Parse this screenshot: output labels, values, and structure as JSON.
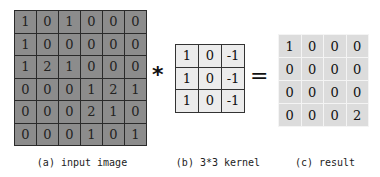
{
  "input_image": {
    "rows": [
      [
        "1",
        "0",
        "1",
        "0",
        "0",
        "0"
      ],
      [
        "1",
        "0",
        "0",
        "0",
        "0",
        "0"
      ],
      [
        "1",
        "2",
        "1",
        "0",
        "0",
        "0"
      ],
      [
        "0",
        "0",
        "0",
        "1",
        "2",
        "1"
      ],
      [
        "0",
        "0",
        "0",
        "2",
        "1",
        "0"
      ],
      [
        "0",
        "0",
        "0",
        "1",
        "0",
        "1"
      ]
    ],
    "caption": "(a) input image"
  },
  "operators": {
    "convolve": "*",
    "equals": "="
  },
  "kernel": {
    "rows": [
      [
        "1",
        "0",
        "-1"
      ],
      [
        "1",
        "0",
        "-1"
      ],
      [
        "1",
        "0",
        "-1"
      ]
    ],
    "caption": "(b) 3*3 kernel"
  },
  "result": {
    "rows": [
      [
        "1",
        "0",
        "0",
        "0"
      ],
      [
        "0",
        "0",
        "0",
        "0"
      ],
      [
        "0",
        "0",
        "0",
        "0"
      ],
      [
        "0",
        "0",
        "0",
        "2"
      ]
    ],
    "caption": "(c) result"
  },
  "colors": {
    "input_fill": "#8c8c8c",
    "kernel_fill": "#ececec",
    "result_fill": "#dcdcdc"
  }
}
